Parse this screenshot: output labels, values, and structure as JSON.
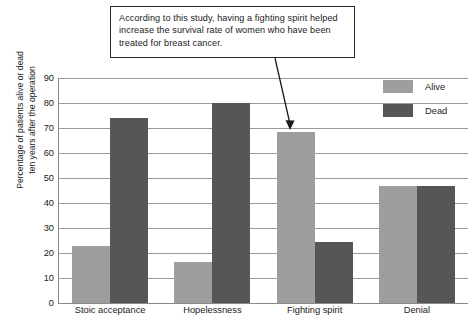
{
  "callout": {
    "text": "According to this study, having a fighting spirit helped increase the survival rate of women who have been treated for breast cancer."
  },
  "chart_data": {
    "type": "bar",
    "title": "",
    "xlabel": "",
    "ylabel": "Percentage of patients alive or dead\nten years after the operation",
    "ylim": [
      0,
      90
    ],
    "yticks": [
      0,
      10,
      20,
      30,
      40,
      50,
      60,
      70,
      80,
      90
    ],
    "grid": true,
    "legend_position": "top-right",
    "categories": [
      "Stoic acceptance",
      "Hopelessness",
      "Fighting spirit",
      "Denial"
    ],
    "series": [
      {
        "name": "Alive",
        "color": "#9e9e9e",
        "values": [
          23,
          16.5,
          68.5,
          47
        ]
      },
      {
        "name": "Dead",
        "color": "#565656",
        "values": [
          74,
          80,
          24.5,
          47
        ]
      }
    ],
    "annotations": [
      {
        "text": "According to this study, having a fighting spirit helped increase the survival rate of women who have been treated for breast cancer.",
        "points_to_category": "Fighting spirit",
        "points_to_series": "Alive",
        "points_to_value": 68.5
      }
    ]
  }
}
